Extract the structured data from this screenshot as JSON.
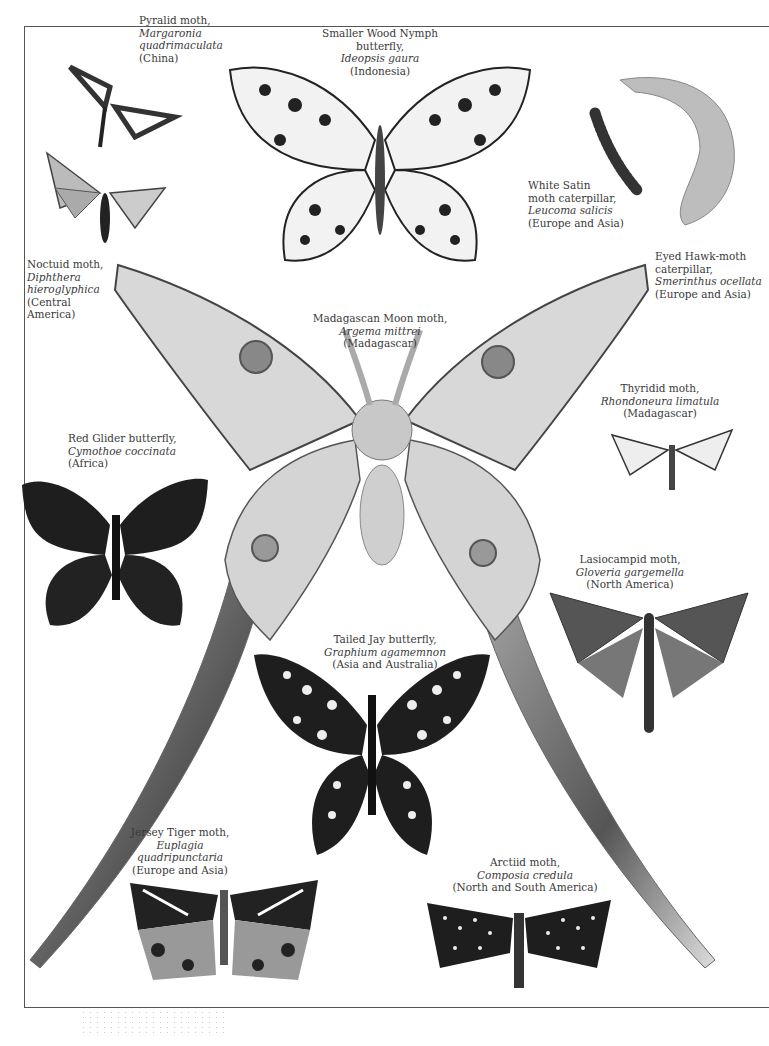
{
  "page": {
    "colors": {
      "background": "#ffffff",
      "frame": "#555555",
      "text": "#3a3a3a"
    }
  },
  "specimens": [
    {
      "id": "pyralid",
      "common": "Pyralid moth,",
      "scientific": "Margaronia quadrimaculata",
      "scientific_lines": [
        "Margaronia",
        "quadrimaculata"
      ],
      "region": "(China)"
    },
    {
      "id": "wood-nymph",
      "common": "Smaller Wood Nymph butterfly,",
      "scientific": "Ideopsis gaura",
      "region": "(Indonesia)"
    },
    {
      "id": "white-satin",
      "common_lines": [
        "White Satin",
        "moth caterpillar,"
      ],
      "scientific": "Leucoma salicis",
      "region": "(Europe and Asia)"
    },
    {
      "id": "noctuid",
      "common": "Noctuid moth,",
      "scientific_lines": [
        "Diphthera",
        "hieroglyphica"
      ],
      "region_lines": [
        "(Central",
        "America)"
      ]
    },
    {
      "id": "eyed-hawk",
      "common_lines": [
        "Eyed Hawk-moth",
        "caterpillar,"
      ],
      "scientific": "Smerinthus ocellata",
      "region": "(Europe and Asia)"
    },
    {
      "id": "moon-moth",
      "common": "Madagascan Moon moth,",
      "scientific": "Argema mittrei",
      "region": "(Madagascar)"
    },
    {
      "id": "thyridid",
      "common": "Thyridid moth,",
      "scientific": "Rhondoneura limatula",
      "region": "(Madagascar)"
    },
    {
      "id": "red-glider",
      "common": "Red Glider butterfly,",
      "scientific": "Cymothoe coccinata",
      "region": "(Africa)"
    },
    {
      "id": "lasiocampid",
      "common": "Lasiocampid moth,",
      "scientific": "Gloveria gargemella",
      "region": "(North America)"
    },
    {
      "id": "tailed-jay",
      "common": "Tailed Jay butterfly,",
      "scientific": "Graphium agamemnon",
      "region": "(Asia and Australia)"
    },
    {
      "id": "jersey-tiger",
      "common": "Jersey Tiger moth,",
      "scientific_lines": [
        "Euplagia",
        "quadripunctaria"
      ],
      "region": "(Europe and Asia)"
    },
    {
      "id": "arctiid",
      "common": "Arctiid moth,",
      "scientific": "Composia credula",
      "region": "(North and South America)"
    }
  ]
}
